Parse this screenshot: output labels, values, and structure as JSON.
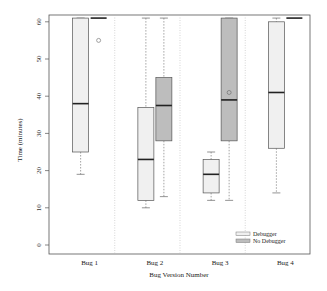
{
  "chart_data": {
    "type": "boxplot",
    "title": "",
    "xlabel": "Bug Version Number",
    "ylabel": "Time (minutes)",
    "ylim": [
      -2,
      62
    ],
    "yticks": [
      0,
      10,
      20,
      30,
      40,
      50,
      60
    ],
    "categories": [
      "Bug 1",
      "Bug 2",
      "Bug 3",
      "Bug 4"
    ],
    "legend": {
      "position": "bottom-right",
      "entries": [
        {
          "label": "Debugger",
          "color": "#f0f0f0"
        },
        {
          "label": "No Debugger",
          "color": "#bdbdbd"
        }
      ]
    },
    "series": [
      {
        "name": "Debugger",
        "color": "#f0f0f0",
        "boxes": [
          {
            "category": "Bug 1",
            "min": 19,
            "q1": 25,
            "median": 38,
            "q3": 61,
            "max": 61,
            "outliers": []
          },
          {
            "category": "Bug 2",
            "min": 10,
            "q1": 12,
            "median": 23,
            "q3": 37,
            "max": 61,
            "outliers": []
          },
          {
            "category": "Bug 3",
            "min": 12,
            "q1": 14,
            "median": 19,
            "q3": 23,
            "max": 25,
            "outliers": []
          },
          {
            "category": "Bug 4",
            "min": 14,
            "q1": 26,
            "median": 41,
            "q3": 60,
            "max": 61,
            "outliers": []
          }
        ]
      },
      {
        "name": "No Debugger",
        "color": "#bdbdbd",
        "boxes": [
          {
            "category": "Bug 1",
            "min": 61,
            "q1": 61,
            "median": 61,
            "q3": 61,
            "max": 61,
            "outliers": [
              55
            ]
          },
          {
            "category": "Bug 2",
            "min": 13,
            "q1": 28,
            "median": 37.5,
            "q3": 45,
            "max": 61,
            "outliers": []
          },
          {
            "category": "Bug 3",
            "min": 12,
            "q1": 28,
            "median": 39,
            "q3": 61,
            "max": 61,
            "outliers": [
              41
            ]
          },
          {
            "category": "Bug 4",
            "min": 61,
            "q1": 61,
            "median": 61,
            "q3": 61,
            "max": 61,
            "outliers": []
          }
        ]
      }
    ],
    "grid": false,
    "group_separators": "dotted vertical lines"
  }
}
